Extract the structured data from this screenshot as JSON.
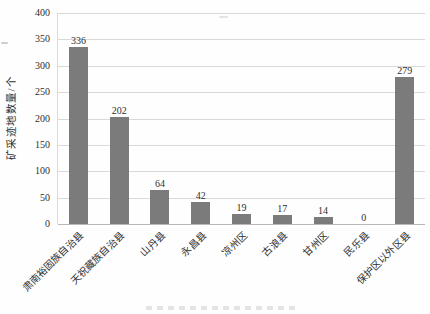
{
  "chart_data": {
    "type": "bar",
    "title": "",
    "categories": [
      "肃南裕固族自治县",
      "天祝藏族自治县",
      "山丹县",
      "永昌县",
      "凉州区",
      "古浪县",
      "甘州区",
      "民乐县",
      "保护区以外区县"
    ],
    "values": [
      336,
      202,
      64,
      42,
      19,
      17,
      14,
      0,
      279
    ],
    "data_labels": [
      "336",
      "202",
      "64",
      "42",
      "19",
      "17",
      "14",
      "0",
      "279"
    ],
    "xlabel": "",
    "ylabel": "矿采迹地数量/个",
    "ylim": [
      0,
      400
    ],
    "ytick_interval": 50,
    "ytick_labels": [
      "400",
      "350",
      "300",
      "250",
      "200",
      "150",
      "100",
      "50",
      "0"
    ],
    "grid": true,
    "legend": "none",
    "bar_color": "#7b7b7b",
    "gridline_color": "#d9d9d9",
    "baseline_color": "#b9b9b9",
    "text_color": "#2f2f2f"
  }
}
